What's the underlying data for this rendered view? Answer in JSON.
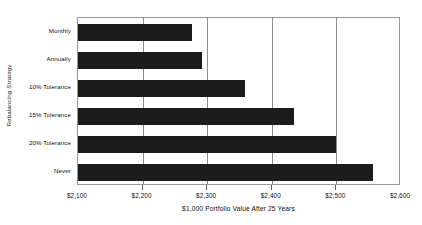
{
  "chart_data": {
    "type": "bar",
    "orientation": "horizontal",
    "title": "",
    "xlabel": "$1,000 Portfolio Value After 25 Years",
    "ylabel": "Rebalancing Strategy",
    "categories": [
      "Monthly",
      "Annually",
      "10% Tolerance",
      "15% Tolerance",
      "20% Tolerance",
      "Never"
    ],
    "values": [
      2277,
      2292,
      2358,
      2434,
      2500,
      2557
    ],
    "xlim": [
      2100,
      2600
    ],
    "xticks": [
      2100,
      2200,
      2300,
      2400,
      2500,
      2600
    ],
    "xtick_labels": [
      "$2,100",
      "$2,200",
      "$2,300",
      "$2,400",
      "$2,500",
      "$2,600"
    ],
    "grid": "vertical",
    "legend": "none",
    "bar_color": "#1c1c1c",
    "plot_border_color": "#9a9a9a",
    "gridline_color": "#8d8d8d",
    "background_color": "#ffffff"
  }
}
